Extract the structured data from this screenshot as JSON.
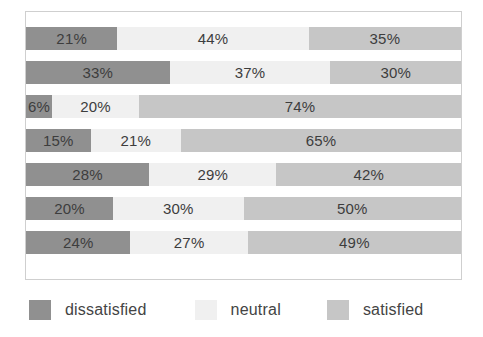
{
  "chart_data": {
    "type": "bar",
    "orientation": "horizontal",
    "stacked": true,
    "normalized_percent": true,
    "title": "",
    "subtitle": "",
    "xlabel": "",
    "ylabel": "",
    "xlim": [
      0,
      100
    ],
    "grid": false,
    "legend_position": "bottom",
    "categories": [
      "1",
      "2",
      "3",
      "4",
      "5",
      "6",
      "7"
    ],
    "series": [
      {
        "name": "dissatisfied",
        "color": "#909090",
        "values": [
          21,
          33,
          6,
          15,
          28,
          20,
          24
        ]
      },
      {
        "name": "neutral",
        "color": "#f0f0f0",
        "values": [
          44,
          37,
          20,
          21,
          29,
          30,
          27
        ]
      },
      {
        "name": "satisfied",
        "color": "#c6c6c6",
        "values": [
          35,
          30,
          74,
          65,
          42,
          50,
          49
        ]
      }
    ],
    "rows": [
      {
        "segments": [
          {
            "series": "dissatisfied",
            "value": 21,
            "label": "21%"
          },
          {
            "series": "neutral",
            "value": 44,
            "label": "44%"
          },
          {
            "series": "satisfied",
            "value": 35,
            "label": "35%"
          }
        ]
      },
      {
        "segments": [
          {
            "series": "dissatisfied",
            "value": 33,
            "label": "33%"
          },
          {
            "series": "neutral",
            "value": 37,
            "label": "37%"
          },
          {
            "series": "satisfied",
            "value": 30,
            "label": "30%"
          }
        ]
      },
      {
        "segments": [
          {
            "series": "dissatisfied",
            "value": 6,
            "label": "6%"
          },
          {
            "series": "neutral",
            "value": 20,
            "label": "20%"
          },
          {
            "series": "satisfied",
            "value": 74,
            "label": "74%"
          }
        ]
      },
      {
        "segments": [
          {
            "series": "dissatisfied",
            "value": 15,
            "label": "15%"
          },
          {
            "series": "neutral",
            "value": 21,
            "label": "21%"
          },
          {
            "series": "satisfied",
            "value": 65,
            "label": "65%"
          }
        ]
      },
      {
        "segments": [
          {
            "series": "dissatisfied",
            "value": 28,
            "label": "28%"
          },
          {
            "series": "neutral",
            "value": 29,
            "label": "29%"
          },
          {
            "series": "satisfied",
            "value": 42,
            "label": "42%"
          }
        ]
      },
      {
        "segments": [
          {
            "series": "dissatisfied",
            "value": 20,
            "label": "20%"
          },
          {
            "series": "neutral",
            "value": 30,
            "label": "30%"
          },
          {
            "series": "satisfied",
            "value": 50,
            "label": "50%"
          }
        ]
      },
      {
        "segments": [
          {
            "series": "dissatisfied",
            "value": 24,
            "label": "24%"
          },
          {
            "series": "neutral",
            "value": 27,
            "label": "27%"
          },
          {
            "series": "satisfied",
            "value": 49,
            "label": "49%"
          }
        ]
      }
    ]
  },
  "legend": {
    "items": [
      {
        "label": "dissatisfied",
        "color": "#909090"
      },
      {
        "label": "neutral",
        "color": "#f0f0f0"
      },
      {
        "label": "satisfied",
        "color": "#c6c6c6"
      }
    ]
  },
  "colors": {
    "dissatisfied": "#909090",
    "neutral": "#f0f0f0",
    "satisfied": "#c6c6c6",
    "frame_border": "#cfcfcf",
    "background": "#ffffff",
    "label_text": "#3d3d3d"
  }
}
